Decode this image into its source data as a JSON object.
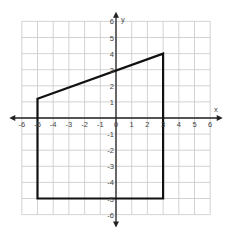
{
  "figure": {
    "axis_labels": {
      "x": "x",
      "y": "y"
    },
    "x_range": [
      -6,
      6
    ],
    "y_range": [
      -6,
      6
    ],
    "x_ticks": [
      "-6",
      "-5",
      "-4",
      "-3",
      "-2",
      "-1",
      "0",
      "1",
      "2",
      "3",
      "4",
      "5",
      "6"
    ],
    "y_ticks": [
      "-6",
      "-5",
      "-4",
      "-3",
      "-2",
      "-1",
      "1",
      "2",
      "3",
      "4",
      "5",
      "6"
    ],
    "polygon": [
      [
        -5,
        1.2
      ],
      [
        3,
        4
      ],
      [
        3,
        -5
      ],
      [
        -5,
        -5
      ]
    ],
    "colors": {
      "grid": "#c8c8c8",
      "axis": "#222222",
      "shape": "#111111"
    }
  }
}
